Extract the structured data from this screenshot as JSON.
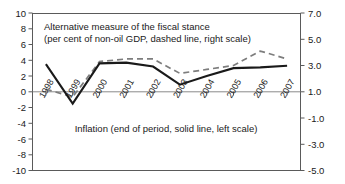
{
  "chart_data": {
    "type": "line",
    "title": "",
    "categories": [
      "1998",
      "1999",
      "2000",
      "2001",
      "2002",
      "2003",
      "2004",
      "2005",
      "2006",
      "2007"
    ],
    "series": [
      {
        "name": "Inflation (end of period, solid line, left scale)",
        "axis": "left",
        "style": "solid",
        "color": "#1a1a1a",
        "values": [
          3.5,
          -1.5,
          3.6,
          3.7,
          3.2,
          0.9,
          2.0,
          3.0,
          3.1,
          3.3
        ]
      },
      {
        "name": "Alternative measure of the fiscal stance (per cent of non-oil GDP, dashed line, right scale)",
        "axis": "right",
        "style": "dashed",
        "color": "#7d7d7d",
        "values": [
          1.2,
          0.6,
          3.3,
          3.5,
          3.5,
          2.4,
          2.7,
          3.0,
          4.1,
          3.5
        ]
      }
    ],
    "xlabel": "",
    "ylabel": "",
    "ylim": [
      -10,
      10
    ],
    "y2lim": [
      -5.0,
      7.0
    ],
    "left_ticks": [
      "10",
      "8",
      "6",
      "4",
      "2",
      "0",
      "-2",
      "-4",
      "-6",
      "-8",
      "-10"
    ],
    "left_tick_values": [
      10,
      8,
      6,
      4,
      2,
      0,
      -2,
      -4,
      -6,
      -8,
      -10
    ],
    "right_ticks": [
      "7.0",
      "5.0",
      "3.0",
      "1.0",
      "-1.0",
      "-3.0",
      "-5.0"
    ],
    "right_tick_values": [
      7.0,
      5.0,
      3.0,
      1.0,
      -1.0,
      -3.0,
      -5.0
    ],
    "grid": false,
    "legend_position": "inline-annotations",
    "annotations": [
      {
        "name": "fiscal-stance-annotation-line1",
        "text": "Alternative measure of the fiscal stance"
      },
      {
        "name": "fiscal-stance-annotation-line2",
        "text": "(per cent of non-oil GDP, dashed line, right scale)"
      },
      {
        "name": "inflation-annotation",
        "text": "Inflation (end of period, solid line, left scale)"
      }
    ]
  },
  "axes": {
    "left_label_0": "10",
    "left_label_1": "8",
    "left_label_2": "6",
    "left_label_3": "4",
    "left_label_4": "2",
    "left_label_5": "0",
    "left_label_6": "-2",
    "left_label_7": "-4",
    "left_label_8": "-6",
    "left_label_9": "-8",
    "left_label_10": "-10",
    "right_label_0": "7.0",
    "right_label_1": "5.0",
    "right_label_2": "3.0",
    "right_label_3": "1.0",
    "right_label_4": "-1.0",
    "right_label_5": "-3.0",
    "right_label_6": "-5.0"
  },
  "x_labels": {
    "y0": "1998",
    "y1": "1999",
    "y2": "2000",
    "y3": "2001",
    "y4": "2002",
    "y5": "2003",
    "y6": "2004",
    "y7": "2005",
    "y8": "2006",
    "y9": "2007"
  },
  "annotations": {
    "title_line1": "Alternative measure of the fiscal stance",
    "title_line2": "(per cent of non-oil GDP, dashed line, right scale)",
    "footer": "Inflation (end of period, solid line, left scale)"
  }
}
